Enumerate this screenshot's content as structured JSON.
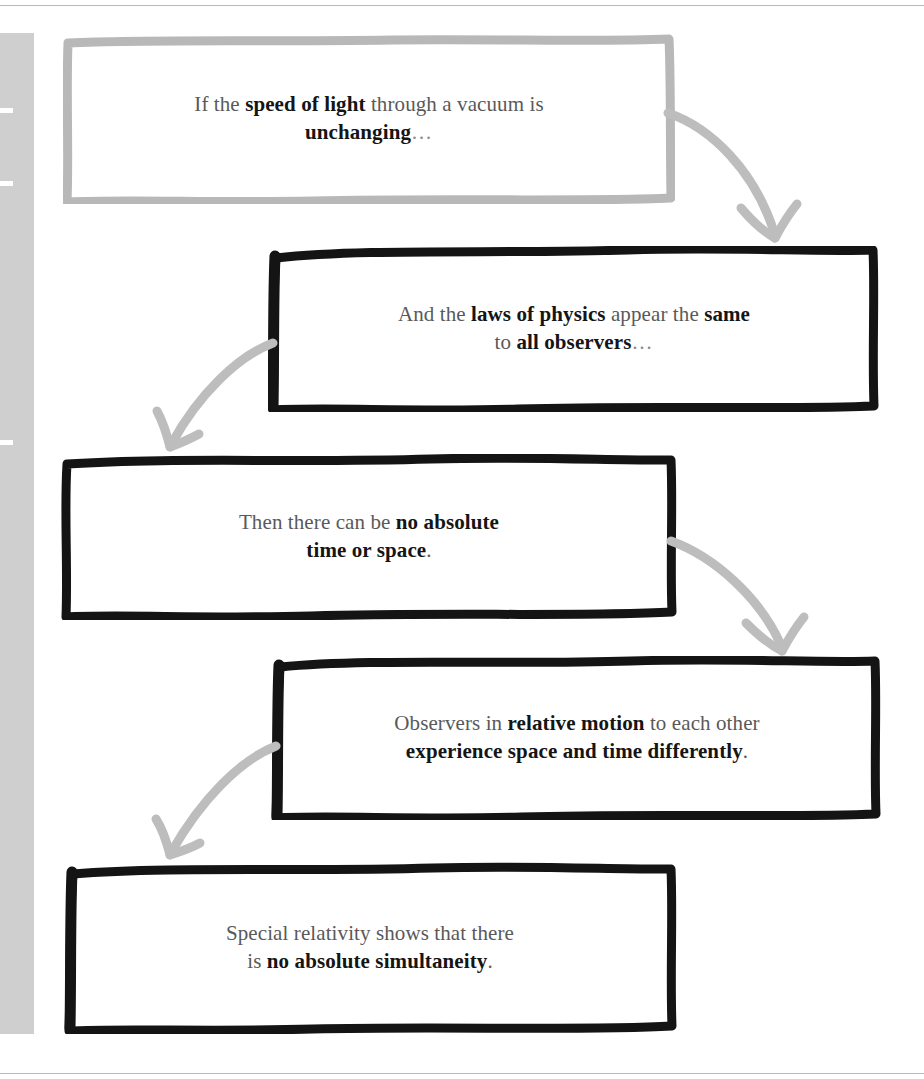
{
  "diagram": {
    "type": "flowchart",
    "orientation": "vertical-zigzag",
    "colors": {
      "ink_black": "#141414",
      "ink_gray": "#b8b8b8",
      "arrow_gray": "#bdbdbd",
      "body_text": "#595959",
      "bold_text": "#151515",
      "gutter": "#cfcfcf",
      "page_rule": "#b9b9b9",
      "background": "#ffffff"
    },
    "nodes": [
      {
        "id": "node-1",
        "order": 1,
        "stroke": "gray",
        "align": "left",
        "line1_pre": "If the ",
        "line1_bold": "speed of light",
        "line1_post": " through a vacuum is",
        "line2_pre": "",
        "line2_bold": "unchanging",
        "line2_post": "…",
        "plain_text": "If the speed of light through a vacuum is unchanging…"
      },
      {
        "id": "node-2",
        "order": 2,
        "stroke": "black",
        "align": "right",
        "line1_pre": "And the ",
        "line1_bold": "laws of physics",
        "line1_post": " appear the ",
        "line1_bold2": "same",
        "line2_pre": "to ",
        "line2_bold": "all observers",
        "line2_post": "…",
        "plain_text": "And the laws of physics appear the same to all observers…"
      },
      {
        "id": "node-3",
        "order": 3,
        "stroke": "black",
        "align": "left",
        "line1_pre": "Then there can be ",
        "line1_bold": "no absolute",
        "line1_post": "",
        "line2_pre": "",
        "line2_bold": "time or space",
        "line2_post": ".",
        "plain_text": "Then there can be no absolute time or space."
      },
      {
        "id": "node-4",
        "order": 4,
        "stroke": "black",
        "align": "right",
        "line1_pre": "Observers in ",
        "line1_bold": "relative motion",
        "line1_post": " to each other",
        "line2_pre": "",
        "line2_bold": "experience space and time differently",
        "line2_post": ".",
        "plain_text": "Observers in relative motion to each other experience space and time differently."
      },
      {
        "id": "node-5",
        "order": 5,
        "stroke": "black",
        "align": "left",
        "line1_pre": "Special relativity shows that there",
        "line1_bold": "",
        "line1_post": "",
        "line2_pre": "is ",
        "line2_bold": "no absolute simultaneity",
        "line2_post": ".",
        "plain_text": "Special relativity shows that there is no absolute simultaneity."
      }
    ],
    "edges": [
      {
        "id": "edge-1-2",
        "from": "node-1",
        "to": "node-2",
        "direction": "down-right"
      },
      {
        "id": "edge-2-3",
        "from": "node-2",
        "to": "node-3",
        "direction": "down-left"
      },
      {
        "id": "edge-3-4",
        "from": "node-3",
        "to": "node-4",
        "direction": "down-right"
      },
      {
        "id": "edge-4-5",
        "from": "node-4",
        "to": "node-5",
        "direction": "down-left"
      }
    ]
  }
}
